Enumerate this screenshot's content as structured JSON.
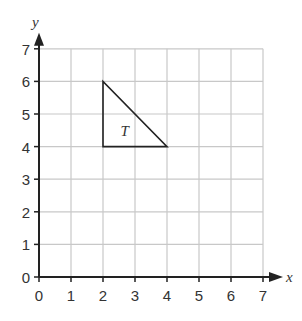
{
  "diagram": {
    "type": "coordinate-grid",
    "x_axis": {
      "label": "x",
      "min": 0,
      "max": 7,
      "ticks": [
        "0",
        "1",
        "2",
        "3",
        "4",
        "5",
        "6",
        "7"
      ]
    },
    "y_axis": {
      "label": "y",
      "min": 0,
      "max": 7,
      "ticks": [
        "0",
        "1",
        "2",
        "3",
        "4",
        "5",
        "6",
        "7"
      ]
    },
    "shapes": [
      {
        "name": "T",
        "label": "T",
        "vertices": [
          [
            2,
            6
          ],
          [
            2,
            4
          ],
          [
            4,
            4
          ]
        ],
        "label_pos": [
          2.55,
          4.5
        ]
      }
    ],
    "colors": {
      "grid": "#c8c8c8",
      "axis": "#222222",
      "shape": "#222222"
    }
  }
}
